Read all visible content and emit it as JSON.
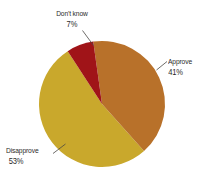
{
  "chart_data": {
    "type": "pie",
    "title": "",
    "categories": [
      "Approve",
      "Disapprove",
      "Don't know"
    ],
    "values": [
      41,
      53,
      7
    ],
    "value_suffix": "%",
    "labels": [
      {
        "name": "Approve",
        "value": 41,
        "value_text": "41%",
        "color": "#b8712a"
      },
      {
        "name": "Disapprove",
        "value": 53,
        "value_text": "53%",
        "color": "#c9a82c"
      },
      {
        "name": "Don't know",
        "value": 7,
        "value_text": "7%",
        "color": "#a01418"
      }
    ],
    "legend": "outside-labels-with-leader-lines",
    "background": "#ffffff",
    "text_color": "#2b2a28",
    "leader_line_color": "#4a4844",
    "start_angle_deg": -8,
    "direction": "clockwise"
  },
  "slices": {
    "approve": {
      "label": "Approve",
      "value_text": "41%",
      "color": "#b8712a",
      "path": "M 102 104 L 110.8 41.4 A 63 63 0 0 1 146.6 150.2 Z"
    },
    "disapprove": {
      "label": "Disapprove",
      "value_text": "53%",
      "color": "#c9a82c",
      "path": "M 102 104 L 146.6 150.2 A 63 63 0 0 1 87.5 42.7 Z"
    },
    "dontknow": {
      "label": "Don't know",
      "value_text": "7%",
      "color": "#a01418",
      "path": "M 102 104 L 87.5 42.7 A 63 63 0 0 1 110.8 41.4 Z"
    }
  },
  "leaders": {
    "dontknow": {
      "x1": 82.5,
      "y1": 30.5,
      "x2": 93.5,
      "y2": 45.5
    },
    "approve": {
      "x1": 167.0,
      "y1": 61.5,
      "x2": 156.5,
      "y2": 70.0
    },
    "disapprove": {
      "x1": 65.5,
      "y1": 144.0,
      "x2": 53.0,
      "y2": 153.5
    }
  }
}
